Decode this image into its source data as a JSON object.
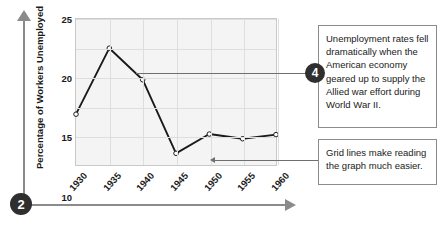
{
  "figure": {
    "step_badge_axes": "2",
    "step_badge_callout": "4"
  },
  "callouts": [
    {
      "id": "callout-unemployment",
      "badge": "4",
      "text": "Unemployment rates fell dramatically when the American economy geared up to supply the Allied war effort during World War II."
    },
    {
      "id": "callout-gridlines",
      "badge": "",
      "text": "Grid lines make reading the graph much easier."
    }
  ],
  "chart_data": {
    "type": "line",
    "title": "",
    "xlabel": "",
    "ylabel": "Percentage of Workers Unemployed",
    "categories": [
      "1930",
      "1935",
      "1940",
      "1945",
      "1950",
      "1955",
      "1960"
    ],
    "x": [
      1930,
      1935,
      1940,
      1945,
      1950,
      1955,
      1960
    ],
    "values": [
      8.7,
      20.0,
      14.6,
      2.0,
      5.3,
      4.5,
      5.2
    ],
    "series": [
      {
        "name": "Percentage of Workers Unemployed",
        "values": [
          8.7,
          20.0,
          14.6,
          2.0,
          5.3,
          4.5,
          5.2
        ]
      }
    ],
    "ylim": [
      0,
      25
    ],
    "yticks": [
      5,
      10,
      15,
      20,
      25
    ],
    "xlim": [
      1930,
      1960
    ],
    "grid": true,
    "legend": "none",
    "line_color": "#1a1a1a",
    "marker": "open-circle",
    "plot_bg": "#f4f4f4",
    "grid_color": "#dedede"
  }
}
